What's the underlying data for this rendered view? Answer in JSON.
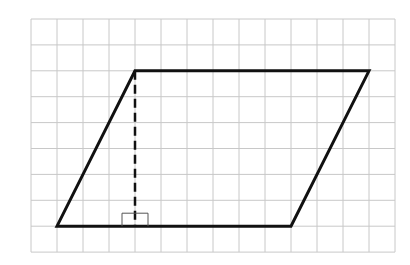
{
  "diagram": {
    "type": "parallelogram-on-grid",
    "grid": {
      "origin_x": 31,
      "origin_y": 19,
      "cols": 14,
      "rows": 9,
      "cell_w": 26,
      "cell_h": 25.9,
      "line_color": "#c8c8c8"
    },
    "parallelogram": {
      "vertices_grid": [
        [
          4,
          2
        ],
        [
          13,
          2
        ],
        [
          10,
          8
        ],
        [
          1,
          8
        ]
      ],
      "stroke": "#111111",
      "stroke_width": 3
    },
    "height_line": {
      "from_grid": [
        4,
        2
      ],
      "to_grid": [
        4,
        8
      ],
      "style": "dashed",
      "stroke": "#111111"
    },
    "right_angle_marker": {
      "at_grid": [
        4,
        8
      ],
      "size_px": 13,
      "stroke": "#555555"
    },
    "colors": {
      "background": "#ffffff",
      "grid": "#c8c8c8",
      "shape": "#111111"
    }
  }
}
